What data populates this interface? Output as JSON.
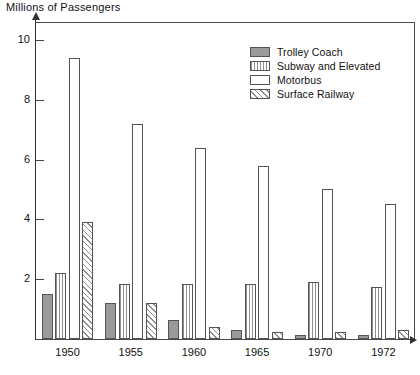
{
  "chart_data": {
    "type": "bar",
    "title": "Millions of Passengers",
    "xlabel": "",
    "ylabel": "Millions of Passengers",
    "categories": [
      "1950",
      "1955",
      "1960",
      "1965",
      "1970",
      "1972"
    ],
    "ylim": [
      0,
      10.6
    ],
    "yticks": [
      2,
      4,
      6,
      8,
      10
    ],
    "ytick_labels": [
      "2",
      "4",
      "6",
      "8",
      "10"
    ],
    "grid": false,
    "legend_position": "top-right",
    "series": [
      {
        "name": "Trolley Coach",
        "pattern": "solid-gray",
        "color": "#9a9a9a",
        "values": [
          1.5,
          1.2,
          0.65,
          0.3,
          0.15,
          0.15
        ]
      },
      {
        "name": "Subway and Elevated",
        "pattern": "vertical-stripes",
        "color": "#8f8f8f",
        "values": [
          2.2,
          1.85,
          1.85,
          1.85,
          1.9,
          1.75
        ]
      },
      {
        "name": "Motorbus",
        "pattern": "empty-white",
        "color": "#ffffff",
        "values": [
          9.4,
          7.2,
          6.4,
          5.8,
          5.0,
          4.5
        ]
      },
      {
        "name": "Surface Railway",
        "pattern": "diagonal-hatch",
        "color": "#8f8f8f",
        "values": [
          3.9,
          1.2,
          0.4,
          0.25,
          0.25,
          0.3
        ]
      }
    ]
  },
  "legend": {
    "items": [
      {
        "label": "Trolley Coach",
        "pattern": "solid-gray"
      },
      {
        "label": "Subway and Elevated",
        "pattern": "vertical-stripes"
      },
      {
        "label": "Motorbus",
        "pattern": "empty-white"
      },
      {
        "label": "Surface Railway",
        "pattern": "diagonal-hatch"
      }
    ]
  }
}
